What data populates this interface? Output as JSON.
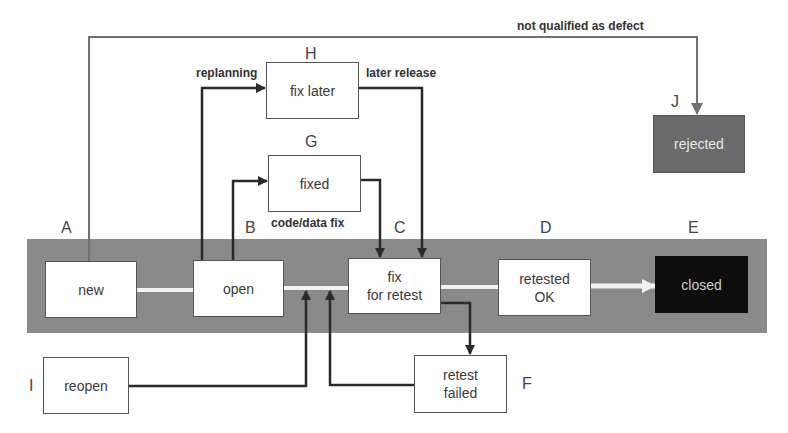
{
  "diagram": {
    "type": "defect-lifecycle-state-diagram",
    "states": {
      "new": {
        "letter": "A",
        "label": "new"
      },
      "open": {
        "letter": "B",
        "label": "open"
      },
      "fix_for_retest": {
        "letter": "C",
        "label": "fix\nfor retest"
      },
      "retested_ok": {
        "letter": "D",
        "label": "retested\nOK"
      },
      "closed": {
        "letter": "E",
        "label": "closed"
      },
      "retest_failed": {
        "letter": "F",
        "label": "retest\nfailed"
      },
      "fixed": {
        "letter": "G",
        "label": "fixed"
      },
      "fix_later": {
        "letter": "H",
        "label": "fix later"
      },
      "reopen": {
        "letter": "I",
        "label": "reopen"
      },
      "rejected": {
        "letter": "J",
        "label": "rejected"
      }
    },
    "transition_labels": {
      "not_qualified": "not qualified as defect",
      "replanning": "replanning",
      "later_release": "later release",
      "code_data_fix": "code/data fix"
    },
    "transitions": [
      {
        "from": "new",
        "to": "open"
      },
      {
        "from": "new",
        "to": "rejected",
        "label": "not qualified as defect"
      },
      {
        "from": "open",
        "to": "fix_later",
        "label": "replanning"
      },
      {
        "from": "open",
        "to": "fixed"
      },
      {
        "from": "fix_later",
        "to": "fix_for_retest",
        "label": "later release"
      },
      {
        "from": "fixed",
        "to": "fix_for_retest",
        "label": "code/data fix"
      },
      {
        "from": "open",
        "to": "fix_for_retest"
      },
      {
        "from": "fix_for_retest",
        "to": "retested_ok"
      },
      {
        "from": "retested_ok",
        "to": "closed"
      },
      {
        "from": "fix_for_retest",
        "to": "retest_failed"
      },
      {
        "from": "retest_failed",
        "to": "open"
      },
      {
        "from": "reopen",
        "to": "open"
      }
    ],
    "colors": {
      "band": "#8a8a8a",
      "closed_fill": "#0d0d0d",
      "rejected_fill": "#6a6a6a",
      "line": "#2a2a2a",
      "flow": "#f2f2f2"
    }
  }
}
